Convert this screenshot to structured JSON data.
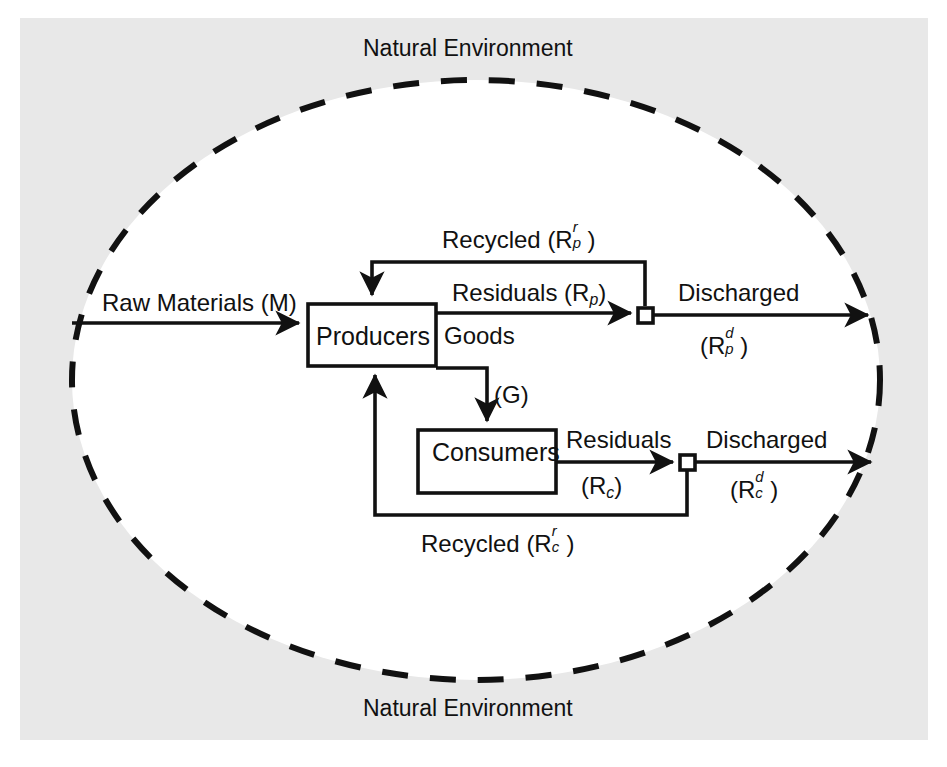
{
  "figure": {
    "type": "materials-balance-flow-diagram",
    "background_color": "#e8e8e8",
    "line_color": "#111111",
    "boundary_style": "dashed-ellipse"
  },
  "environment": {
    "top_label": "Natural Environment",
    "bottom_label": "Natural Environment"
  },
  "nodes": [
    {
      "id": "producers",
      "label": "Producers"
    },
    {
      "id": "consumers",
      "label": "Consumers"
    }
  ],
  "junctions": [
    {
      "id": "producer-residual-junction"
    },
    {
      "id": "consumer-residual-junction"
    }
  ],
  "flows": {
    "raw_materials": {
      "text": "Raw Materials (M)",
      "symbol": "M"
    },
    "recycled_producers": {
      "prefix": "Recycled (R",
      "sup": "r",
      "sub": "p",
      "suffix": ")"
    },
    "residuals_producers": {
      "prefix": "Residuals (R",
      "sub": "p",
      "suffix": ")"
    },
    "discharged_producers": {
      "text": "Discharged",
      "prefix": "(R",
      "sup": "d",
      "sub": "p",
      "suffix": ")"
    },
    "goods": {
      "text": "Goods",
      "symbol": "(G)"
    },
    "residuals_consumers": {
      "text": "Residuals",
      "prefix": "(R",
      "sub": "c",
      "suffix": ")"
    },
    "discharged_consumers": {
      "text": "Discharged",
      "prefix": "(R",
      "sup": "d",
      "sub": "c",
      "suffix": ")"
    },
    "recycled_consumers": {
      "prefix": "Recycled (R",
      "sup": "r",
      "sub": "c",
      "suffix": ")"
    }
  }
}
